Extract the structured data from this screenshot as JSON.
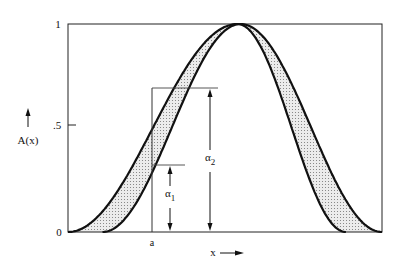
{
  "figure": {
    "y_axis_label": "A(x)",
    "x_axis_label": "x",
    "y_ticks": [
      {
        "value": 0,
        "label": "0"
      },
      {
        "value": 0.5,
        "label": ".5"
      },
      {
        "value": 1,
        "label": "1"
      }
    ],
    "x_marker": {
      "label": "a",
      "x": 0.27
    },
    "alpha1": {
      "label": "α",
      "sub": "1",
      "value": 0.32
    },
    "alpha2": {
      "label": "α",
      "sub": "2",
      "value": 0.69
    },
    "colors": {
      "ink": "#111111",
      "shade": "#d9d9d9"
    }
  },
  "chart_data": {
    "type": "line",
    "title": "",
    "xlabel": "x",
    "ylabel": "A(x)",
    "xlim": [
      0,
      1
    ],
    "ylim": [
      0,
      1
    ],
    "grid": false,
    "series": [
      {
        "name": "left curve",
        "start": 0.0,
        "peak": 0.54,
        "end": 0.885
      },
      {
        "name": "right curve",
        "start": 0.11,
        "peak": 0.55,
        "end": 1.0
      }
    ],
    "shaded_region": "between the two curves",
    "annotations": [
      {
        "text": "a",
        "x": 0.27
      },
      {
        "text": "α1",
        "value": 0.32
      },
      {
        "text": "α2",
        "value": 0.69
      }
    ]
  }
}
